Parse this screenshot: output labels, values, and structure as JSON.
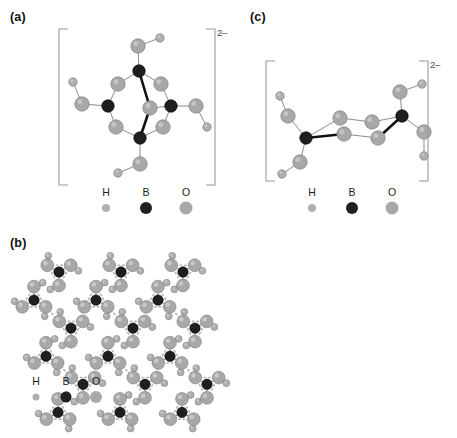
{
  "figure": {
    "background": "#ffffff",
    "colors": {
      "hydrogen": "#b0b0b0",
      "boron": "#1f1f1f",
      "oxygen": "#a8a8a8",
      "bond": "#8c8c8c",
      "bond_bold": "#111111",
      "hbond": "#b5b5b5",
      "bracket": "#9a9a9a",
      "text": "#1a1a1a"
    },
    "atom_radii": {
      "hydrogen": 4.2,
      "boron": 6.2,
      "oxygen": 7.2
    }
  },
  "panels": [
    {
      "id": "a",
      "label": "(a)",
      "charge": "2–",
      "description": "cyclic triborate anion with boron-oxygen six-membered ring",
      "legend": {
        "items": [
          {
            "symbol": "H",
            "species": "hydrogen",
            "radius": 4.2,
            "color": "#b0b0b0"
          },
          {
            "symbol": "B",
            "species": "boron",
            "radius": 6.2,
            "color": "#1f1f1f"
          },
          {
            "symbol": "O",
            "species": "oxygen",
            "radius": 7.2,
            "color": "#a8a8a8"
          }
        ]
      }
    },
    {
      "id": "b",
      "label": "(b)",
      "charge": "",
      "description": "extended hexagonal hydrogen-bonded boric acid layer",
      "legend": {
        "items": [
          {
            "symbol": "H",
            "species": "hydrogen",
            "radius": 4.2,
            "color": "#b0b0b0"
          },
          {
            "symbol": "B",
            "species": "boron",
            "radius": 6.2,
            "color": "#1f1f1f"
          },
          {
            "symbol": "O",
            "species": "oxygen",
            "radius": 7.2,
            "color": "#a8a8a8"
          }
        ]
      }
    },
    {
      "id": "c",
      "label": "(c)",
      "charge": "2–",
      "description": "diborate chain anion bridged by two oxygen atoms",
      "legend": {
        "items": [
          {
            "symbol": "H",
            "species": "hydrogen",
            "radius": 4.2,
            "color": "#b0b0b0"
          },
          {
            "symbol": "B",
            "species": "boron",
            "radius": 6.2,
            "color": "#1f1f1f"
          },
          {
            "symbol": "O",
            "species": "oxygen",
            "radius": 7.2,
            "color": "#a8a8a8"
          }
        ]
      }
    }
  ],
  "structures": {
    "a": {
      "atoms": [
        {
          "e": "B",
          "x": 73,
          "y": 39
        },
        {
          "e": "B",
          "x": 42,
          "y": 74
        },
        {
          "e": "B",
          "x": 105,
          "y": 74
        },
        {
          "e": "B",
          "x": 74,
          "y": 106
        },
        {
          "e": "O",
          "x": 52,
          "y": 52
        },
        {
          "e": "O",
          "x": 95,
          "y": 52
        },
        {
          "e": "O",
          "x": 50,
          "y": 95
        },
        {
          "e": "O",
          "x": 97,
          "y": 95
        },
        {
          "e": "O",
          "x": 84,
          "y": 76
        },
        {
          "e": "O",
          "x": 72,
          "y": 14
        },
        {
          "e": "H",
          "x": 94,
          "y": 6
        },
        {
          "e": "O",
          "x": 16,
          "y": 72
        },
        {
          "e": "H",
          "x": 7,
          "y": 50
        },
        {
          "e": "O",
          "x": 130,
          "y": 74
        },
        {
          "e": "H",
          "x": 141,
          "y": 95
        },
        {
          "e": "O",
          "x": 74,
          "y": 132
        },
        {
          "e": "H",
          "x": 52,
          "y": 141
        }
      ],
      "bonds": [
        {
          "a": 0,
          "b": 4,
          "w": 1
        },
        {
          "a": 0,
          "b": 5,
          "w": 1
        },
        {
          "a": 1,
          "b": 4,
          "w": 1
        },
        {
          "a": 2,
          "b": 5,
          "w": 1
        },
        {
          "a": 1,
          "b": 6,
          "w": 1
        },
        {
          "a": 2,
          "b": 7,
          "w": 1
        },
        {
          "a": 3,
          "b": 6,
          "w": 1
        },
        {
          "a": 3,
          "b": 7,
          "w": 1
        },
        {
          "a": 0,
          "b": 8,
          "w": 2
        },
        {
          "a": 3,
          "b": 8,
          "w": 2
        },
        {
          "a": 2,
          "b": 8,
          "w": 1
        },
        {
          "a": 0,
          "b": 9,
          "w": 1
        },
        {
          "a": 9,
          "b": 10,
          "w": 1
        },
        {
          "a": 1,
          "b": 11,
          "w": 1
        },
        {
          "a": 11,
          "b": 12,
          "w": 1
        },
        {
          "a": 2,
          "b": 13,
          "w": 1
        },
        {
          "a": 13,
          "b": 14,
          "w": 1
        },
        {
          "a": 3,
          "b": 15,
          "w": 1
        },
        {
          "a": 15,
          "b": 16,
          "w": 1
        }
      ]
    },
    "c": {
      "atoms": [
        {
          "e": "B",
          "x": 32,
          "y": 74
        },
        {
          "e": "B",
          "x": 128,
          "y": 52
        },
        {
          "e": "O",
          "x": 66,
          "y": 54
        },
        {
          "e": "O",
          "x": 98,
          "y": 58
        },
        {
          "e": "O",
          "x": 70,
          "y": 70
        },
        {
          "e": "O",
          "x": 104,
          "y": 74
        },
        {
          "e": "O",
          "x": 14,
          "y": 52
        },
        {
          "e": "H",
          "x": 6,
          "y": 32
        },
        {
          "e": "O",
          "x": 26,
          "y": 98
        },
        {
          "e": "H",
          "x": 8,
          "y": 110
        },
        {
          "e": "O",
          "x": 126,
          "y": 28
        },
        {
          "e": "H",
          "x": 148,
          "y": 20
        },
        {
          "e": "O",
          "x": 150,
          "y": 68
        },
        {
          "e": "H",
          "x": 150,
          "y": 92
        }
      ],
      "bonds": [
        {
          "a": 0,
          "b": 2,
          "w": 1
        },
        {
          "a": 2,
          "b": 3,
          "w": 1
        },
        {
          "a": 3,
          "b": 1,
          "w": 1
        },
        {
          "a": 0,
          "b": 4,
          "w": 2
        },
        {
          "a": 4,
          "b": 5,
          "w": 1
        },
        {
          "a": 5,
          "b": 1,
          "w": 2
        },
        {
          "a": 0,
          "b": 6,
          "w": 1
        },
        {
          "a": 6,
          "b": 7,
          "w": 1
        },
        {
          "a": 0,
          "b": 8,
          "w": 1
        },
        {
          "a": 8,
          "b": 9,
          "w": 1
        },
        {
          "a": 1,
          "b": 10,
          "w": 1
        },
        {
          "a": 10,
          "b": 11,
          "w": 1
        },
        {
          "a": 1,
          "b": 12,
          "w": 1
        },
        {
          "a": 12,
          "b": 13,
          "w": 1
        }
      ]
    },
    "b": {
      "lattice": {
        "description": "hexagonal network of B(OH)3 units linked by O-H...O hydrogen bonds",
        "cell_dx": 62,
        "cell_dy": 54,
        "cols": 4,
        "rows": 3,
        "ring_radius": 26,
        "origin_x": 22,
        "origin_y": 26,
        "shear": 24
      }
    }
  }
}
